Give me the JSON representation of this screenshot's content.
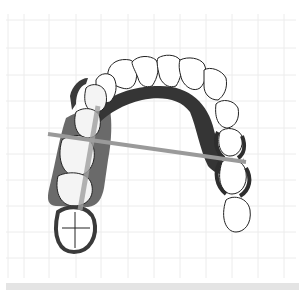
{
  "diagram": {
    "colors": {
      "background": "#ffffff",
      "grid": "#ececec",
      "tooth_outline": "#222222",
      "tooth_fill": "#ffffff",
      "denture_base": "#5a5a5a",
      "major_connector": "#3a3a3a",
      "clasp": "#2e2e2e",
      "fulcrum_line": "#9a9a9a",
      "bottom_bar": "#e4e4e4"
    },
    "grid": {
      "x_lines": [
        8,
        24,
        49,
        76,
        101,
        128,
        154,
        180,
        206,
        232,
        258,
        284
      ],
      "y_lines": [
        20,
        48,
        75,
        101,
        128,
        154,
        180,
        206,
        232,
        258
      ]
    },
    "elements": {
      "anterior_teeth": "Anterior teeth (outlined, unrestored)",
      "left_denture_base": "Denture base (left posterior)",
      "palatal_strap": "Palatal strap major connector",
      "right_clasps": "Right posterior clasps",
      "fulcrum_line": "Fulcrum line"
    }
  }
}
